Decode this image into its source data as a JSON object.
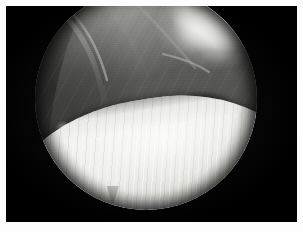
{
  "image": {
    "kind": "arthroscopic-photograph",
    "caption": "",
    "alt_text": "Arthroscopic view of a joint showing soft tissue above and a bright articular cartilage surface below within a circular endoscope field.",
    "modality_label": "",
    "frame": {
      "border_color": "#fdfdfd",
      "background_color": "#050505",
      "width_px": 303,
      "height_px": 232
    },
    "scope_field": {
      "shape": "circle",
      "center_x_px": 140,
      "center_y_px": 99,
      "radius_px": 111,
      "clipped_edges": "top"
    },
    "regions": [
      {
        "name": "soft-tissue-upper",
        "description": "Grey synovial soft tissue filling the upper half of the field",
        "tone": "#5e5e5c"
      },
      {
        "name": "fibrous-band-left",
        "description": "Pale curved fibrous band or ligament arcing through the upper left",
        "tone": "#8d8d88"
      },
      {
        "name": "bright-nodular-upper-right",
        "description": "Bright nodular villous tissue at the upper right of the field",
        "tone": "#e8e7e2"
      },
      {
        "name": "dark-recess-right",
        "description": "Dark shadowed recess between tissue and cartilage at mid right",
        "tone": "#101010"
      },
      {
        "name": "tissue-tag-left",
        "description": "Small bright tissue tag at the lower left margin",
        "tone": "#d7d6d0"
      },
      {
        "name": "cartilage-surface",
        "description": "Bright convex articular cartilage surface with fine diagonal striations across the lower half",
        "tone": "#f3f3ef"
      },
      {
        "name": "cartilage-notch",
        "description": "Small pointed projection at the lower border of the cartilage surface",
        "tone": "#b9b9b3"
      }
    ],
    "palette": {
      "border": "#fdfdfd",
      "backdrop": "#050505",
      "tissue_dark": "#303030",
      "tissue_mid": "#5e5e5c",
      "tissue_light": "#8d8d88",
      "highlight": "#e8e7e2",
      "cartilage": "#f3f3ef",
      "cartilage_shadow": "#aeaea8"
    }
  }
}
